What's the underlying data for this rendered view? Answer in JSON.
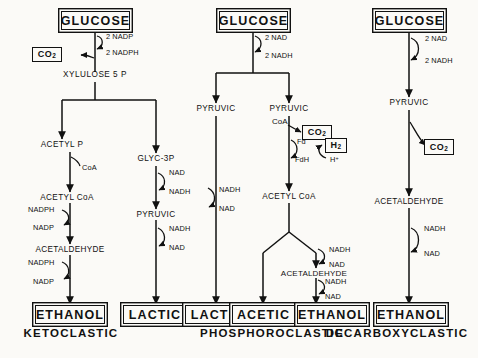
{
  "figure": {
    "background": "#fbfaf7",
    "ink": "#111111"
  },
  "pathways": [
    {
      "id": "ketoclastic",
      "name": "KETOCLASTIC",
      "substrate": "GLUCOSE",
      "products": [
        "ETHANOL",
        "LACTIC"
      ],
      "intermediates": [
        "XYLULOSE 5 P",
        "ACETYL P",
        "GLYC-3P",
        "ACETYL CoA",
        "PYRUVIC",
        "ACETALDEHYDE"
      ],
      "byproducts": [
        "CO2"
      ],
      "cofactors": [
        "2 NADP",
        "2 NADPH",
        "CoA",
        "NAD",
        "NADH",
        "NADPH",
        "NADP"
      ]
    },
    {
      "id": "phosphoroclastic",
      "name": "PHOSPHOROCLASTIC",
      "substrate": "GLUCOSE",
      "products": [
        "LACTIC",
        "ACETIC",
        "ETHANOL"
      ],
      "intermediates": [
        "PYRUVIC",
        "ACETYL CoA",
        "ACETALDEHYDE"
      ],
      "byproducts": [
        "CO2",
        "H2"
      ],
      "cofactors": [
        "2 NAD",
        "2 NADH",
        "CoA",
        "Fd",
        "FdH",
        "H+",
        "NADH",
        "NAD"
      ]
    },
    {
      "id": "decarboxyclastic",
      "name": "DECARBOXYCLASTIC",
      "substrate": "GLUCOSE",
      "products": [
        "ETHANOL"
      ],
      "intermediates": [
        "PYRUVIC",
        "ACETALDEHYDE"
      ],
      "byproducts": [
        "CO2"
      ],
      "cofactors": [
        "2 NAD",
        "2 NADH",
        "NADH",
        "NAD"
      ]
    }
  ],
  "labels": {
    "glucose": "GLUCOSE",
    "ethanol": "ETHANOL",
    "lactic": "LACTIC",
    "acetic": "ACETIC",
    "pyruvic": "PYRUVIC",
    "acetyl_p": "ACETYL P",
    "acetyl_coa": "ACETYL CoA",
    "acetaldehyde": "ACETALDEHYDE",
    "xylulose5p": "XYLULOSE 5 P",
    "glyc3p": "GLYC-3P",
    "coa": "CoA",
    "fd": "Fd",
    "fdh": "FdH",
    "hplus": "H",
    "hplus_sup": "+",
    "co2_main": "CO",
    "co2_sub": "2",
    "h2_main": "H",
    "h2_sub": "2",
    "nad": "NAD",
    "nadh": "NADH",
    "nadp": "NADP",
    "nadph": "NADPH",
    "two_nad": "2 NAD",
    "two_nadh": "2 NADH",
    "two_nadp": "2 NADP",
    "two_nadph": "2 NADPH",
    "ketoclastic": "KETOCLASTIC",
    "phosphoroclastic": "PHOSPHOROCLASTIC",
    "decarboxyclastic": "DECARBOXYCLASTIC"
  }
}
